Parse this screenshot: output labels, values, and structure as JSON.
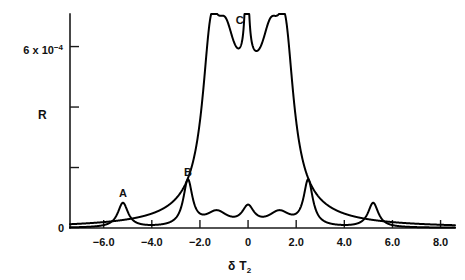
{
  "chart_data": {
    "type": "line",
    "title": "",
    "xlabel": "δ T₂",
    "ylabel": "R",
    "xlim": [
      -7.4,
      8.6
    ],
    "ylim": [
      0,
      0.00092
    ],
    "grid": false,
    "legend": "none",
    "x_ticks": [
      {
        "value": -6.0,
        "label": "−6.0"
      },
      {
        "value": -4.0,
        "label": "−4.0"
      },
      {
        "value": -2.0,
        "label": "−2.0"
      },
      {
        "value": 0.0,
        "label": "0"
      },
      {
        "value": 2.0,
        "label": "2.0"
      },
      {
        "value": 4.0,
        "label": "4.0"
      },
      {
        "value": 6.0,
        "label": "6.0"
      },
      {
        "value": 8.0,
        "label": "8.0"
      }
    ],
    "y_ticks": [
      {
        "value": 0.0,
        "label": "0"
      },
      {
        "value": 0.00026,
        "label": ""
      },
      {
        "value": 0.00052,
        "label": ""
      },
      {
        "value": 0.00078,
        "label": "6 x 10⁻⁴"
      }
    ],
    "y_tick_main_mantissa": "6 x 10",
    "y_tick_main_exponent": "−4",
    "annotations": [
      {
        "text": "A",
        "x": -5.2,
        "y": 0.000135
      },
      {
        "text": "B",
        "x": -2.5,
        "y": 0.000225
      },
      {
        "text": "C",
        "x": -0.35,
        "y": 0.000875
      }
    ],
    "series": [
      {
        "name": "sharp-resonance-curve",
        "comment": "Narrow Lorentzian peaks labelled A and B with mirrored partners, plus small central structure",
        "points": [
          [
            -7.4,
            0.0
          ],
          [
            -7.0,
            0.0
          ],
          [
            -6.6,
            0.0
          ],
          [
            -6.3,
            0.0
          ],
          [
            -6.1,
            0.0
          ],
          [
            -5.95,
            0.0
          ],
          [
            -5.85,
            0.0
          ],
          [
            -5.75,
            0.0
          ],
          [
            -5.65,
            0.0
          ],
          [
            -5.58,
            0.0
          ],
          [
            -5.5,
            0.0
          ],
          [
            -5.44,
            0.0
          ],
          [
            -5.38,
            0.0
          ],
          [
            -5.33,
            0.0
          ],
          [
            -5.29,
            0.0
          ],
          [
            -5.25,
            0.0
          ],
          [
            -5.22,
            0.0
          ],
          [
            -5.2,
            0.0
          ],
          [
            -5.18,
            0.0
          ],
          [
            -5.15,
            0.0
          ],
          [
            -5.11,
            0.0
          ],
          [
            -5.06,
            0.0
          ],
          [
            -5.0,
            0.0
          ],
          [
            -4.92,
            0.0
          ],
          [
            -4.82,
            0.0
          ],
          [
            -4.7,
            0.0
          ],
          [
            -4.55,
            0.0
          ],
          [
            -4.35,
            0.0
          ],
          [
            -4.1,
            0.0
          ],
          [
            -3.85,
            0.0
          ],
          [
            -3.55,
            0.0
          ],
          [
            -3.25,
            0.0
          ],
          [
            -3.0,
            0.0
          ],
          [
            -2.85,
            0.0
          ],
          [
            -2.75,
            0.0
          ],
          [
            -2.68,
            0.0
          ],
          [
            -2.62,
            0.0
          ],
          [
            -2.57,
            0.0
          ],
          [
            -2.53,
            0.0
          ],
          [
            -2.5,
            0.0
          ],
          [
            -2.47,
            0.0
          ],
          [
            -2.43,
            0.0
          ],
          [
            -2.38,
            0.0
          ],
          [
            -2.32,
            0.0
          ],
          [
            -2.25,
            0.0
          ],
          [
            -2.15,
            0.0
          ],
          [
            -2.0,
            0.0
          ],
          [
            -1.8,
            0.0
          ],
          [
            -1.55,
            0.0
          ],
          [
            -1.3,
            0.0
          ],
          [
            -1.05,
            0.0
          ],
          [
            -0.85,
            0.0
          ],
          [
            -0.7,
            0.0
          ],
          [
            -0.55,
            0.0
          ],
          [
            -0.42,
            0.0
          ],
          [
            -0.3,
            0.0
          ],
          [
            -0.2,
            0.0
          ],
          [
            -0.12,
            0.0
          ],
          [
            -0.06,
            0.0
          ],
          [
            0.0,
            0.0
          ],
          [
            0.06,
            0.0
          ],
          [
            0.12,
            0.0
          ],
          [
            0.2,
            0.0
          ],
          [
            0.3,
            0.0
          ],
          [
            0.42,
            0.0
          ],
          [
            0.55,
            0.0
          ],
          [
            0.7,
            0.0
          ],
          [
            0.85,
            0.0
          ],
          [
            1.05,
            0.0
          ],
          [
            1.3,
            0.0
          ],
          [
            1.55,
            0.0
          ],
          [
            1.8,
            0.0
          ],
          [
            2.0,
            0.0
          ],
          [
            2.15,
            0.0
          ],
          [
            2.25,
            0.0
          ],
          [
            2.32,
            0.0
          ],
          [
            2.38,
            0.0
          ],
          [
            2.43,
            0.0
          ],
          [
            2.47,
            0.0
          ],
          [
            2.5,
            0.0
          ],
          [
            2.53,
            0.0
          ],
          [
            2.57,
            0.0
          ],
          [
            2.62,
            0.0
          ],
          [
            2.68,
            0.0
          ],
          [
            2.75,
            0.0
          ],
          [
            2.85,
            0.0
          ],
          [
            3.0,
            0.0
          ],
          [
            3.25,
            0.0
          ],
          [
            3.55,
            0.0
          ],
          [
            3.85,
            0.0
          ],
          [
            4.1,
            0.0
          ],
          [
            4.35,
            0.0
          ],
          [
            4.55,
            0.0
          ],
          [
            4.7,
            0.0
          ],
          [
            4.82,
            0.0
          ],
          [
            4.92,
            0.0
          ],
          [
            5.0,
            0.0
          ],
          [
            5.06,
            0.0
          ],
          [
            5.11,
            0.0
          ],
          [
            5.15,
            0.0
          ],
          [
            5.18,
            0.0
          ],
          [
            5.2,
            0.0
          ],
          [
            5.22,
            0.0
          ],
          [
            5.25,
            0.0
          ],
          [
            5.29,
            0.0
          ],
          [
            5.33,
            0.0
          ],
          [
            5.38,
            0.0
          ],
          [
            5.44,
            0.0
          ],
          [
            5.5,
            0.0
          ],
          [
            5.58,
            0.0
          ],
          [
            5.65,
            0.0
          ],
          [
            5.75,
            0.0
          ],
          [
            5.85,
            0.0
          ],
          [
            6.0,
            0.0
          ],
          [
            6.3,
            0.0
          ],
          [
            6.7,
            0.0
          ],
          [
            7.2,
            0.0
          ],
          [
            7.8,
            0.0
          ],
          [
            8.4,
            0.0
          ]
        ],
        "lorentzians": [
          {
            "center": -5.2,
            "amplitude": 0.000105,
            "halfwidth": 0.26
          },
          {
            "center": -2.5,
            "amplitude": 0.000195,
            "halfwidth": 0.23
          },
          {
            "center": 2.5,
            "amplitude": 0.000195,
            "halfwidth": 0.23
          },
          {
            "center": 5.2,
            "amplitude": 0.000105,
            "halfwidth": 0.26
          },
          {
            "center": -1.3,
            "amplitude": 6.2e-05,
            "halfwidth": 0.55
          },
          {
            "center": 0.0,
            "amplitude": 7.8e-05,
            "halfwidth": 0.3
          },
          {
            "center": 1.3,
            "amplitude": 6.2e-05,
            "halfwidth": 0.55
          }
        ]
      },
      {
        "name": "broad-plateau-curve",
        "comment": "Tall flat-topped band from about -1.9 to 1.9 with two shoulder peaks and a narrow central spike C",
        "lorentzians": [
          {
            "center": -1.55,
            "amplitude": 0.000555,
            "halfwidth": 0.42
          },
          {
            "center": 1.55,
            "amplitude": 0.000555,
            "halfwidth": 0.42
          },
          {
            "center": -0.95,
            "amplitude": 0.000455,
            "halfwidth": 0.55
          },
          {
            "center": 0.95,
            "amplitude": 0.000455,
            "halfwidth": 0.55
          },
          {
            "center": 0.0,
            "amplitude": 0.00043,
            "halfwidth": 0.95
          },
          {
            "center": -0.05,
            "amplitude": 0.00044,
            "halfwidth": 0.085
          }
        ]
      }
    ]
  },
  "axis": {
    "y_label_text": "R",
    "x_label_delta": "δ",
    "x_label_T": "T",
    "x_label_sub": "2"
  }
}
